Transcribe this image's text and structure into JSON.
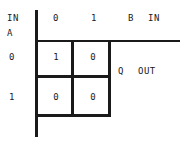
{
  "diagram": {
    "axis_labels": {
      "row_header_line1": "IN",
      "row_header_line2": "A",
      "col_input_letter": "B",
      "col_input_word": "IN",
      "output_letter": "Q",
      "output_word": "OUT"
    },
    "column_headers": [
      "0",
      "1"
    ],
    "row_headers": [
      "0",
      "1"
    ],
    "cells": [
      [
        "1",
        "0"
      ],
      [
        "0",
        "0"
      ]
    ],
    "colors": {
      "ink": "#1a1a1a",
      "background": "#ffffff"
    }
  }
}
